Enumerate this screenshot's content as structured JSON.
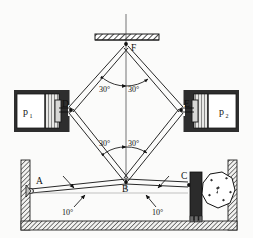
{
  "figure": {
    "type": "mechanism-diagram",
    "background_color": "#fbfbfa",
    "line_color": "#111111",
    "hatch_color": "#5a5a5a",
    "block_color": "#2b2b2b"
  },
  "points": [
    {
      "id": "A",
      "label": "A",
      "x": 31,
      "y": 191,
      "kind": "pin-joint-wall"
    },
    {
      "id": "B",
      "label": "B",
      "x": 126,
      "y": 182,
      "kind": "pin-joint"
    },
    {
      "id": "C",
      "label": "C",
      "x": 186,
      "y": 184,
      "kind": "pin-joint-jaw"
    },
    {
      "id": "D",
      "label": "D",
      "x": 71,
      "y": 110,
      "kind": "pin-joint"
    },
    {
      "id": "E",
      "label": "E",
      "x": 181,
      "y": 110,
      "kind": "pin-joint"
    },
    {
      "id": "F",
      "label": "F",
      "x": 126,
      "y": 44,
      "kind": "pin-joint-ground"
    }
  ],
  "angles": [
    {
      "label": "30°",
      "value": 30,
      "unit": "deg",
      "x": 107,
      "y": 89,
      "location": "upper-left-of-vertical-at-F"
    },
    {
      "label": "30°",
      "value": 30,
      "unit": "deg",
      "x": 134,
      "y": 89,
      "location": "upper-right-of-vertical-at-F"
    },
    {
      "label": "30°",
      "value": 30,
      "unit": "deg",
      "x": 107,
      "y": 144,
      "location": "lower-left-of-vertical-at-B"
    },
    {
      "label": "30°",
      "value": 30,
      "unit": "deg",
      "x": 134,
      "y": 144,
      "location": "lower-right-of-vertical-at-B"
    },
    {
      "label": "10°",
      "value": 10,
      "unit": "deg",
      "x": 70,
      "y": 212,
      "location": "left-lever-AB-to-horizontal"
    },
    {
      "label": "10°",
      "value": 10,
      "unit": "deg",
      "x": 160,
      "y": 212,
      "location": "right-lever-BC-to-horizontal"
    }
  ],
  "pressures": [
    {
      "id": "p1",
      "base": "p",
      "subscript": "1",
      "side": "left",
      "x": 26,
      "y": 111
    },
    {
      "id": "p2",
      "base": "p",
      "subscript": "2",
      "side": "right",
      "x": 224,
      "y": 111
    }
  ],
  "links": [
    {
      "name": "FD",
      "from": "F",
      "to": "D",
      "style": "double-line"
    },
    {
      "name": "FE",
      "from": "F",
      "to": "E",
      "style": "double-line"
    },
    {
      "name": "DB",
      "from": "D",
      "to": "B",
      "style": "double-line"
    },
    {
      "name": "EB",
      "from": "E",
      "to": "B",
      "style": "double-line"
    },
    {
      "name": "AB",
      "from": "A",
      "to": "B",
      "style": "double-line"
    },
    {
      "name": "BC",
      "from": "B",
      "to": "C",
      "style": "double-line"
    }
  ],
  "components": {
    "top_support": {
      "name": "ground-hatch-support",
      "x": 95,
      "y": 34,
      "width": 64,
      "height": 6
    },
    "centerline": {
      "name": "vertical-centerline",
      "x": 126,
      "y_top": 14,
      "y_bottom": 190
    },
    "left_cylinder": {
      "name": "hydraulic-cylinder-left",
      "x": 14,
      "y": 90,
      "width": 54,
      "height": 42
    },
    "right_cylinder": {
      "name": "hydraulic-cylinder-right",
      "x": 185,
      "y": 90,
      "width": 54,
      "height": 42
    },
    "crusher_jaw": {
      "name": "crusher-jaw-block",
      "x": 190,
      "y": 172,
      "width": 12,
      "height": 48
    },
    "rock": {
      "name": "rock-being-crushed",
      "cx": 219,
      "cy": 196
    },
    "enclosure": {
      "name": "crusher-housing",
      "x": 21,
      "y": 160,
      "width": 216,
      "height": 70
    }
  },
  "leaders": [
    {
      "name": "leader-left-link",
      "from_x": 63,
      "from_y": 179,
      "to_x": 74,
      "to_y": 189
    },
    {
      "name": "leader-left-angle",
      "from_x": 74,
      "from_y": 206,
      "to_x": 84,
      "to_y": 194
    },
    {
      "name": "leader-right-link",
      "from_x": 168,
      "from_y": 179,
      "to_x": 157,
      "to_y": 189
    },
    {
      "name": "leader-right-angle",
      "from_x": 157,
      "from_y": 206,
      "to_x": 147,
      "to_y": 194
    }
  ]
}
